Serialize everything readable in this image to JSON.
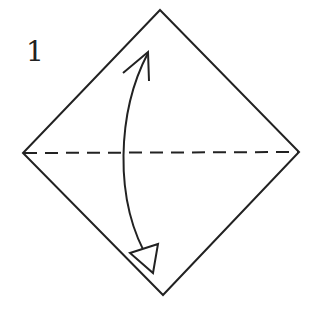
{
  "diagram": {
    "step_number": "1",
    "stroke_color": "#222222",
    "background": "#ffffff",
    "paper_square": {
      "shape": "diamond",
      "vertices": {
        "top": [
          160,
          10
        ],
        "right": [
          299,
          152
        ],
        "bottom": [
          163,
          295
        ],
        "left": [
          23,
          153
        ]
      }
    },
    "fold_line": {
      "type": "valley-fold-dashed",
      "from": [
        23,
        153
      ],
      "to": [
        299,
        152
      ]
    },
    "fold_arrow": {
      "description": "curved two-way arrow: fold bottom to top and unfold",
      "top_head": "open-arrowhead",
      "bottom_head": "hollow-triangle-arrowhead"
    }
  }
}
